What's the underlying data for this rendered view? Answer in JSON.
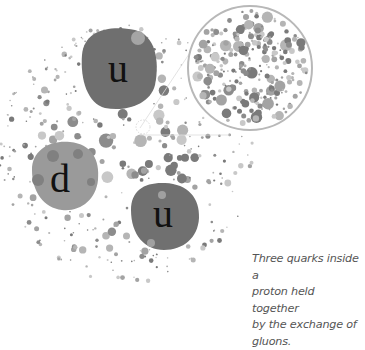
{
  "diagram": {
    "quarks": [
      {
        "label": "u",
        "cx": 120,
        "cy": 70,
        "r": 38
      },
      {
        "label": "d",
        "cx": 65,
        "cy": 178,
        "r": 33
      },
      {
        "label": "u",
        "cx": 165,
        "cy": 217,
        "r": 34
      }
    ],
    "magnifier": {
      "cx": 250,
      "cy": 68,
      "r": 62
    },
    "colors": {
      "quark_dark": "#6e6e6e",
      "quark_light": "#9a9a9a",
      "gluon_dark": "#7a7a7a",
      "gluon_mid": "#a3a3a3",
      "gluon_light": "#c4c4c4",
      "magnifier_ring": "#b8b8b8"
    }
  },
  "caption": {
    "line1": "Three quarks inside a",
    "line2": "proton held together",
    "line3": "by the exchange of",
    "line4": "gluons."
  }
}
